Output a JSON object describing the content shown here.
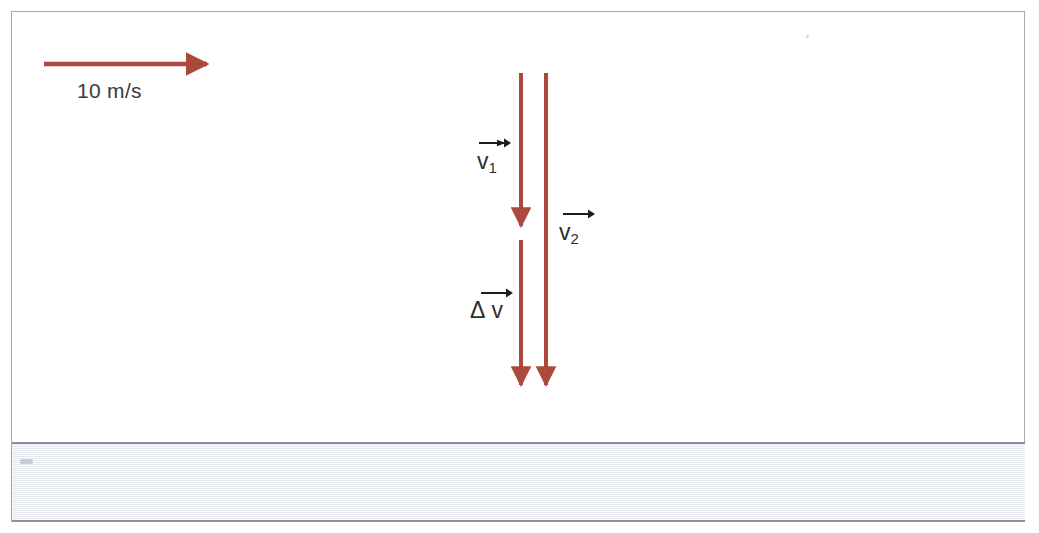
{
  "figure": {
    "kind": "physics-vector-diagram",
    "background_color": "#ffffff",
    "frame_color": "#a9a9ad",
    "vector_color": "#a94a3c",
    "text_color": "#3a3a3c",
    "ground_color": "#eceff4",
    "ground_border_color": "#8e9095"
  },
  "labels": {
    "speed": "10 m/s",
    "v1_symbol": "v",
    "v1_subscript": "1",
    "v2_symbol": "v",
    "v2_subscript": "2",
    "delta_symbol": "Δ",
    "delta_v_symbol": "v"
  },
  "vectors": {
    "horizontal_reference": {
      "name": "10 m/s",
      "orientation": "horizontal",
      "direction": "right",
      "x_start": 44,
      "x_end": 215,
      "y": 64,
      "color": "#a94a3c"
    },
    "v1": {
      "name": "v1",
      "orientation": "vertical",
      "direction": "down",
      "x": 521,
      "y_start": 73,
      "y_end": 234,
      "color": "#a94a3c"
    },
    "v2": {
      "name": "v2",
      "orientation": "vertical",
      "direction": "down",
      "x": 546,
      "y_start": 73,
      "y_end": 393,
      "color": "#a94a3c"
    },
    "delta_v": {
      "name": "delta-v",
      "orientation": "vertical",
      "direction": "down",
      "x": 521,
      "y_start": 240,
      "y_end": 393,
      "color": "#a94a3c"
    }
  },
  "ground": {
    "name": "ground-band",
    "top": 442,
    "height": 80
  }
}
